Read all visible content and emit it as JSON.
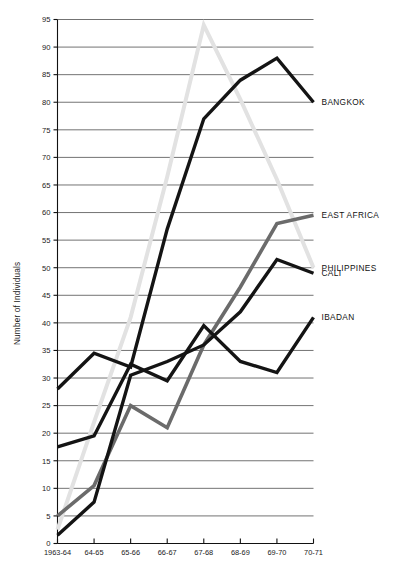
{
  "chart_data": {
    "type": "line",
    "title": "",
    "subtitle": "",
    "xlabel": "",
    "ylabel": "Number of Individuals",
    "categories": [
      "1963-64",
      "64-65",
      "65-66",
      "66-67",
      "67-68",
      "68-69",
      "69-70",
      "70-71"
    ],
    "x": [
      0,
      1,
      2,
      3,
      4,
      5,
      6,
      7
    ],
    "ylim": [
      0,
      95
    ],
    "xlim": [
      0,
      7
    ],
    "ytick_labels": [
      "0",
      "5",
      "10",
      "15",
      "20",
      "25",
      "30",
      "35",
      "40",
      "45",
      "50",
      "55",
      "60",
      "65",
      "70",
      "75",
      "80",
      "85",
      "90",
      "95"
    ],
    "ytick_values": [
      0,
      5,
      10,
      15,
      20,
      25,
      30,
      35,
      40,
      45,
      50,
      55,
      60,
      65,
      70,
      75,
      80,
      85,
      90,
      95
    ],
    "grid": true,
    "grid_axis": "y",
    "legend_position": "right-inline-labels",
    "series": [
      {
        "name": "BANGKOK",
        "color": "#141414",
        "width": 3.4,
        "label": "BANGKOK",
        "label_value": 80,
        "values": [
          28,
          34.5,
          32,
          57,
          77,
          84,
          88,
          80
        ]
      },
      {
        "name": "PHILIPPINES",
        "color": "#e2e2e2",
        "width": 4.0,
        "label": "PHILIPPINES",
        "label_value": 50,
        "values": [
          2.5,
          22,
          41,
          66.5,
          94,
          80.5,
          66,
          50
        ]
      },
      {
        "name": "EAST AFRICA",
        "color": "#6b6b6b",
        "width": 3.6,
        "label": "EAST AFRICA",
        "label_value": 59.5,
        "values": [
          5,
          10.5,
          25,
          21,
          36,
          46.5,
          58,
          59.5
        ]
      },
      {
        "name": "CALI",
        "color": "#141414",
        "width": 3.4,
        "label": "CALI",
        "label_value": 49,
        "values": [
          1.5,
          7.5,
          30.5,
          33,
          36,
          42,
          51.5,
          49
        ]
      },
      {
        "name": "IBADAN",
        "color": "#141414",
        "width": 3.4,
        "label": "IBADAN",
        "label_value": 41,
        "values": [
          17.5,
          19.5,
          32.5,
          29.5,
          39.5,
          33,
          31,
          41
        ]
      }
    ]
  },
  "axes": {
    "y_axis_title": "Number of Individuals",
    "x_axis_title": ""
  }
}
